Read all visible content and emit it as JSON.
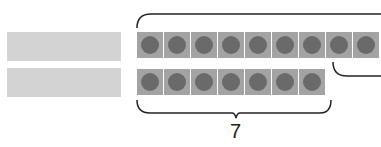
{
  "diagram": {
    "left_bars": [
      {
        "name": "top-gray-bar"
      },
      {
        "name": "bottom-gray-bar"
      }
    ],
    "top_row": {
      "tile_count_visible": 9,
      "tiles": [
        1,
        2,
        3,
        4,
        5,
        6,
        7,
        8,
        9
      ]
    },
    "bottom_row": {
      "tile_count": 7,
      "tiles": [
        1,
        2,
        3,
        4,
        5,
        6,
        7
      ]
    },
    "bottom_bracket_label": "7",
    "colors": {
      "bar": "#d3d3d3",
      "tile": "#a3a3a3",
      "dot": "#6a6a6a",
      "bracket": "#222222"
    }
  }
}
